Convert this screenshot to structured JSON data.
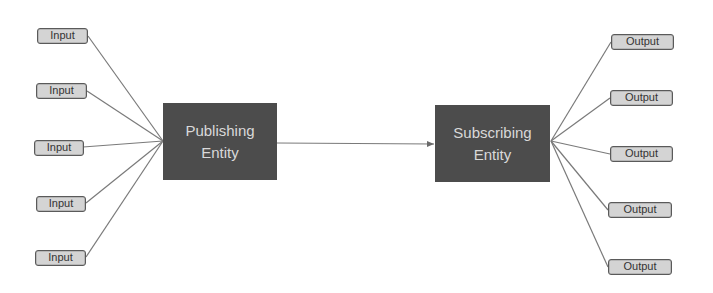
{
  "diagram": {
    "type": "publish-subscribe",
    "colors": {
      "entity_fill": "#4c4c4c",
      "entity_text": "#d9d9d9",
      "io_fill": "#d4d4d4",
      "io_border": "#5a5a5a",
      "connector": "#7a7a7a"
    },
    "publisher": {
      "line1": "Publishing",
      "line2": "Entity"
    },
    "subscriber": {
      "line1": "Subscribing",
      "line2": "Entity"
    },
    "inputs": [
      {
        "label": "Input"
      },
      {
        "label": "Input"
      },
      {
        "label": "Input"
      },
      {
        "label": "Input"
      },
      {
        "label": "Input"
      }
    ],
    "outputs": [
      {
        "label": "Output"
      },
      {
        "label": "Output"
      },
      {
        "label": "Output"
      },
      {
        "label": "Output"
      },
      {
        "label": "Output"
      }
    ],
    "edges": [
      {
        "from": "publisher",
        "to": "subscriber",
        "arrow": true
      }
    ]
  }
}
